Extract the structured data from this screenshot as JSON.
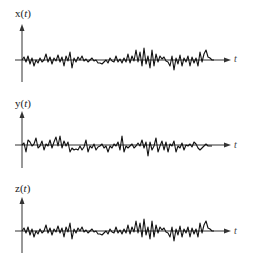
{
  "panels": [
    {
      "id": "x",
      "label": "x(t)",
      "label_name": "x",
      "arg": "t",
      "axis_label": "t"
    },
    {
      "id": "y",
      "label": "y(t)",
      "label_name": "y",
      "arg": "t",
      "axis_label": "t"
    },
    {
      "id": "z",
      "label": "z(t)",
      "label_name": "z",
      "arg": "t",
      "axis_label": "t"
    }
  ],
  "colors": {
    "axis": "#333333",
    "signal": "#111111",
    "background": "#ffffff"
  }
}
